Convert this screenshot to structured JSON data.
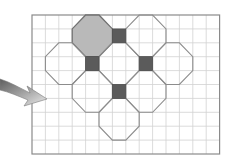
{
  "diagram": {
    "type": "grid-tiling",
    "grid": {
      "origin_x": 32,
      "origin_y": 15,
      "cols": 14,
      "rows": 10,
      "cell_w": 13.4,
      "cell_h": 13.9,
      "line_color": "#d2d2d2",
      "border_color": "#8a8a8a"
    },
    "octagons": [
      {
        "id": "oct-top-left",
        "col": 3,
        "row": 0,
        "size": 3,
        "filled": true
      },
      {
        "id": "oct-top-right",
        "col": 7,
        "row": 0,
        "size": 3,
        "filled": false
      },
      {
        "id": "oct-mid-left",
        "col": 1,
        "row": 2,
        "size": 3,
        "filled": false
      },
      {
        "id": "oct-center",
        "col": 5,
        "row": 2,
        "size": 3,
        "filled": false
      },
      {
        "id": "oct-mid-right",
        "col": 9,
        "row": 2,
        "size": 3,
        "filled": false
      },
      {
        "id": "oct-lower-left",
        "col": 3,
        "row": 4,
        "size": 3,
        "filled": false
      },
      {
        "id": "oct-lower-right",
        "col": 7,
        "row": 4,
        "size": 3,
        "filled": false
      },
      {
        "id": "oct-bottom",
        "col": 5,
        "row": 6,
        "size": 3,
        "filled": false
      }
    ],
    "squares": [
      {
        "id": "sq-1",
        "col": 6,
        "row": 1
      },
      {
        "id": "sq-2",
        "col": 4,
        "row": 3
      },
      {
        "id": "sq-3",
        "col": 8,
        "row": 3
      },
      {
        "id": "sq-4",
        "col": 6,
        "row": 5
      }
    ],
    "colors": {
      "octagon_fill": "#b9b9b9",
      "octagon_stroke": "#8c8c8c",
      "octagon_stroke_filled": "#707070",
      "square_fill": "#5b5b5b",
      "arrow_light": "#e6e6e6",
      "arrow_dark": "#6e6e6e"
    },
    "arrow": {
      "direction": "right",
      "tip_x": 47,
      "tip_y": 99
    }
  }
}
